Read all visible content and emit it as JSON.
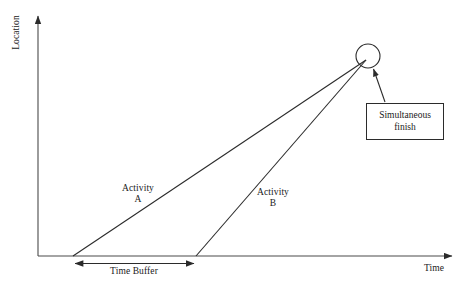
{
  "diagram": {
    "type": "time-location-chart",
    "axes": {
      "y_label": "Location",
      "x_label": "Time",
      "origin": {
        "x": 38,
        "y": 256
      },
      "y_top": {
        "x": 38,
        "y": 13
      },
      "x_right": {
        "x": 456,
        "y": 256
      }
    },
    "activities": [
      {
        "name": "Activity A",
        "label_line1": "Activity",
        "label_line2": "A",
        "start": {
          "x": 73,
          "y": 256
        },
        "end": {
          "x": 366,
          "y": 60
        }
      },
      {
        "name": "Activity B",
        "label_line1": "Activity",
        "label_line2": "B",
        "start": {
          "x": 196,
          "y": 256
        },
        "end": {
          "x": 366,
          "y": 60
        }
      }
    ],
    "time_buffer": {
      "label": "Time Buffer",
      "from_x": 73,
      "to_x": 196,
      "y": 263
    },
    "finish_marker": {
      "name": "simultaneous-finish-circle",
      "cx": 368,
      "cy": 56,
      "r": 12
    },
    "callout": {
      "line1": "Simultaneous",
      "line2": "finish",
      "box": {
        "x": 366,
        "y": 103,
        "w": 78,
        "h": 37
      },
      "leader_from": {
        "x": 385,
        "y": 103
      },
      "leader_to": {
        "x": 373,
        "y": 69
      }
    },
    "colors": {
      "stroke": "#2b2b2b",
      "axis": "#4a4a4a",
      "text": "#1a1a1a",
      "background": "#ffffff"
    }
  }
}
